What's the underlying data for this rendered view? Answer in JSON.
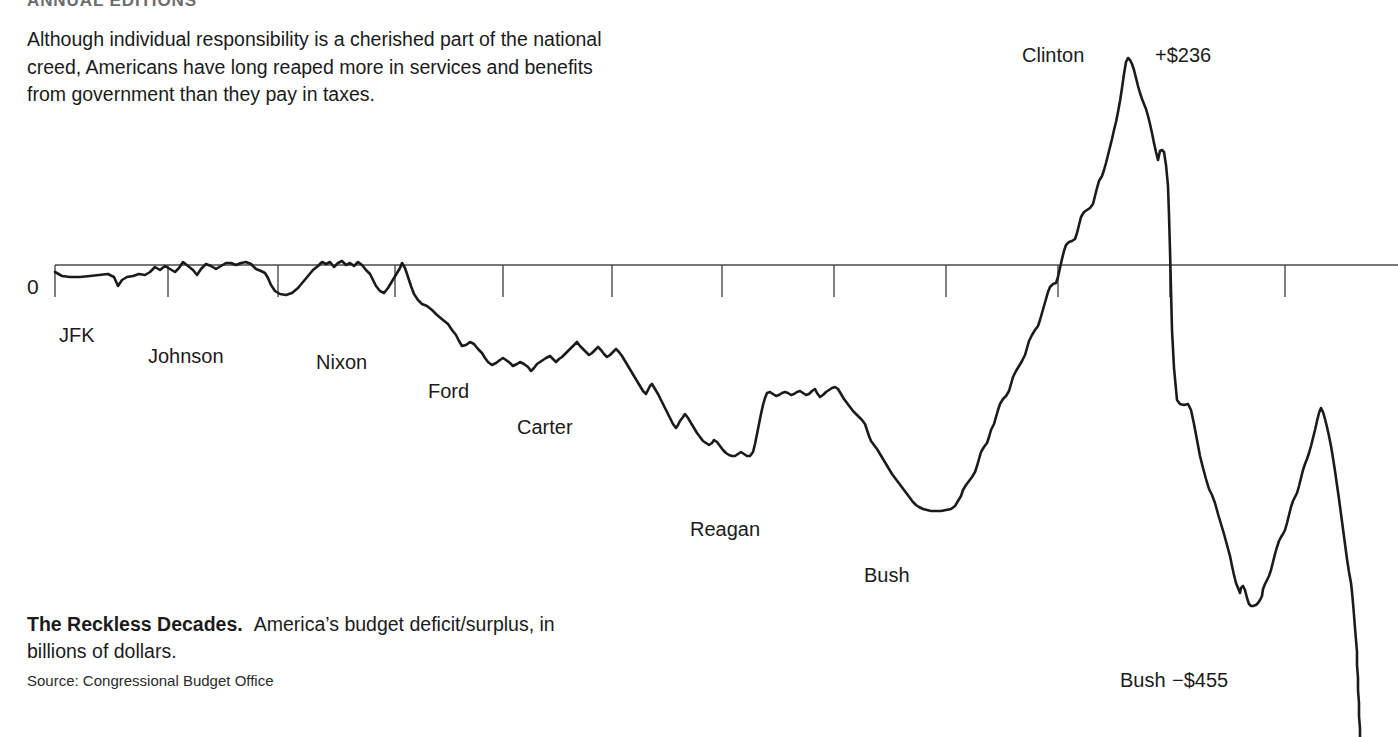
{
  "running_head": "ANNUAL EDITIONS",
  "intro": {
    "lines": [
      "Although individual responsibility is a cherished part of the national",
      "creed, Americans have long reaped more in services and benefits",
      "from government than they pay in taxes."
    ]
  },
  "caption": {
    "title": "The Reckless Decades.",
    "body_line1": "America’s budget deficit/surplus, in",
    "body_line2": "billions of dollars.",
    "source": "Source: Congressional Budget Office"
  },
  "axis": {
    "zero_label": "0",
    "line_color": "#4a4a4a",
    "tick_color": "#4a4a4a"
  },
  "chart_data": {
    "type": "line",
    "title": "The Reckless Decades.",
    "subtitle": "America’s budget deficit/surplus, in billions of dollars.",
    "source": "Congressional Budget Office",
    "xlabel": "",
    "ylabel": "Billions of dollars",
    "grid": false,
    "legend_position": "none",
    "zero_baseline": 0,
    "series_name": "Federal budget deficit / surplus",
    "line_color": "#1b1b1b",
    "line_width": 2.6,
    "annotations": [
      {
        "name": "clinton-peak-label",
        "text": "Clinton",
        "x": 1022,
        "y": 45
      },
      {
        "name": "clinton-peak-value",
        "text": "+$236",
        "x": 1155,
        "y": 45
      },
      {
        "name": "bush2-trough-label",
        "text": "Bush",
        "x": 1120,
        "y": 670
      },
      {
        "name": "bush2-trough-value",
        "text": "−$455",
        "x": 1172,
        "y": 670
      }
    ],
    "president_labels": [
      {
        "name": "jfk",
        "text": "JFK",
        "x": 59,
        "y": 325
      },
      {
        "name": "johnson",
        "text": "Johnson",
        "x": 148,
        "y": 346
      },
      {
        "name": "nixon",
        "text": "Nixon",
        "x": 316,
        "y": 352
      },
      {
        "name": "ford",
        "text": "Ford",
        "x": 428,
        "y": 381
      },
      {
        "name": "carter",
        "text": "Carter",
        "x": 517,
        "y": 417
      },
      {
        "name": "reagan",
        "text": "Reagan",
        "x": 690,
        "y": 519
      },
      {
        "name": "bush",
        "text": "Bush",
        "x": 864,
        "y": 565
      }
    ],
    "tick_x_positions": [
      55,
      168,
      278,
      395,
      503,
      612,
      722,
      834,
      946,
      1058,
      1170,
      1285
    ],
    "zero_line_y": 265,
    "zero_line_x_start": 55,
    "zero_line_x_end": 1398,
    "labeled_values": {
      "clinton_surplus": 236,
      "bush_deficit": -455
    },
    "points": "55,272 62,276 70,277 80,277 90,276 99,275 108,274 114,277 118,286 122,280 127,277 133,276 139,274 145,275 150,272 155,267 160,270 165,266 170,269 175,272 179,268 183,262 188,266 193,270 197,275 201,269 206,264 211,266 216,269 221,266 226,263 231,263 236,265 241,263 246,262 251,264 256,269 261,271 265,273 268,278 271,285 275,291 280,294 286,295 292,293 298,288 303,282 308,276 313,270 318,266 322,262 326,264 330,262 334,267 338,263 342,261 346,265 350,263 354,266 358,262 362,265 366,270 370,274 373,280 376,286 380,291 384,293 388,288 391,283 394,278 397,273 400,268 402,263 405,268 408,277 411,286 414,294 418,300 422,304 427,306 432,310 437,315 443,320 448,324 452,330 456,335 459,341 462,346 466,345 470,342 474,344 478,349 482,353 485,358 488,362 492,365 496,363 500,360 503,358 506,360 510,363 513,366 517,364 520,362 524,364 528,367 531,371 534,368 537,364 540,362 543,360 546,358 550,356 553,359 556,362 559,359 562,357 565,354 568,351 571,348 574,345 577,342 580,346 583,349 586,352 589,355 592,353 595,350 598,347 601,350 604,354 607,357 610,355 613,352 616,349 619,352 622,356 625,361 628,366 631,371 634,376 637,381 640,386 643,391 646,394 648,390 650,386 652,384 655,389 658,394 661,400 664,406 667,412 670,418 673,424 676,428 678,425 680,421 683,417 685,414 688,418 691,423 694,428 697,433 700,437 703,441 706,443 709,445 712,443 714,440 717,442 720,446 723,450 726,453 729,455 732,456 735,456 738,454 741,452 744,454 747,456 750,456 753,452 755,444 757,434 759,424 761,414 763,405 765,398 767,393 770,392 773,394 776,396 779,395 782,393 785,392 788,393 791,395 794,394 797,392 800,391 803,393 806,395 809,394 812,391 815,389 817,393 820,397 823,395 826,392 829,390 832,388 835,387 838,389 841,394 844,399 847,403 850,407 853,411 856,414 859,417 862,420 865,424 867,430 869,436 871,441 874,445 877,449 880,454 883,459 886,464 889,469 892,474 895,478 898,482 901,486 904,490 907,494 910,498 913,502 916,505 919,507 923,509 927,510 931,511 936,511 941,511 946,510 951,509 955,506 958,501 961,496 963,490 966,485 969,481 972,477 975,472 977,466 979,459 981,452 984,447 987,443 989,437 991,430 994,424 996,417 998,410 1000,404 1003,399 1006,396 1009,391 1011,384 1013,377 1016,371 1019,366 1022,361 1025,355 1027,348 1029,341 1032,335 1035,330 1038,326 1040,320 1042,313 1044,306 1046,299 1048,292 1050,287 1053,284 1056,283 1058,277 1060,268 1062,259 1064,251 1066,245 1069,242 1072,241 1075,239 1077,233 1079,225 1081,217 1084,212 1087,210 1090,208 1093,204 1095,196 1097,188 1099,181 1102,176 1104,170 1106,163 1108,155 1110,147 1112,139 1114,130 1116,122 1118,112 1120,101 1122,88 1124,74 1126,62 1128,58 1130,60 1132,64 1134,70 1136,78 1138,86 1140,93 1142,99 1144,104 1146,109 1148,116 1150,124 1152,133 1154,143 1156,152 1158,160 1160,151 1162,150 1164,152 1166,165 1168,186 1169,215 1170,250 1171,290 1172,330 1174,368 1177,400 1180,404 1184,405 1188,404 1191,410 1194,424 1197,440 1200,456 1203,468 1206,479 1209,489 1212,495 1215,503 1218,514 1221,524 1224,534 1227,545 1230,556 1232,566 1234,575 1236,583 1238,588 1240,593 1241,588 1243,586 1245,590 1247,598 1249,604 1251,606 1253,606 1256,605 1258,603 1260,600 1262,596 1263,589 1265,584 1267,580 1269,576 1271,570 1273,562 1275,554 1277,547 1279,541 1281,537 1283,534 1285,530 1287,523 1289,515 1291,507 1293,501 1295,497 1297,493 1299,486 1301,478 1303,470 1305,464 1307,459 1309,453 1311,446 1313,438 1315,430 1317,421 1319,413 1321,408 1323,412 1325,419 1327,427 1329,436 1331,446 1333,458 1335,471 1337,485 1339,499 1341,514 1343,529 1345,544 1347,559 1349,572 1351,583 1352,592 1353,603 1354,615 1355,628 1356,640 1357,652 1357,665 1358,678 1358,690 1359,703 1359,716 1360,729 1360,737"
  }
}
